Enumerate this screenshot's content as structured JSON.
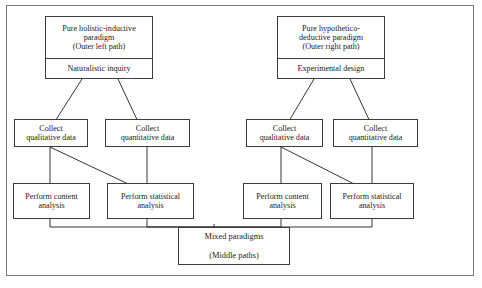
{
  "diagram": {
    "frame": {
      "border_color": "#7a7a7a"
    },
    "left_path": {
      "header": {
        "title_line1": "Pure holistic-inductive",
        "title_line2": "paradigm",
        "title_line3": "(Outer left path)",
        "subtitle": "Naturalistic inquiry"
      },
      "collect_qualitative_line1": "Collect",
      "collect_qualitative_line2": "qualitative data",
      "collect_quantitative_line1": "Collect",
      "collect_quantitative_line2": "quantitative data",
      "perform_content_line1": "Perform content",
      "perform_content_line2": "analysis",
      "perform_statistical_line1": "Perform statistical",
      "perform_statistical_line2": "analysis"
    },
    "right_path": {
      "header": {
        "title_line1": "Pure hypothetico-",
        "title_line2": "deductive paradigm",
        "title_line3": "(Outer right path)",
        "subtitle": "Experimental design"
      },
      "collect_qualitative_line1": "Collect",
      "collect_qualitative_line2": "qualitative data",
      "collect_quantitative_line1": "Collect",
      "collect_quantitative_line2": "quantitative data",
      "perform_content_line1": "Perform content",
      "perform_content_line2": "analysis",
      "perform_statistical_line1": "Perform statistical",
      "perform_statistical_line2": "analysis"
    },
    "merge": {
      "line1": "Mixed paradigms",
      "line2": "(Middle paths)"
    },
    "caption": ""
  }
}
